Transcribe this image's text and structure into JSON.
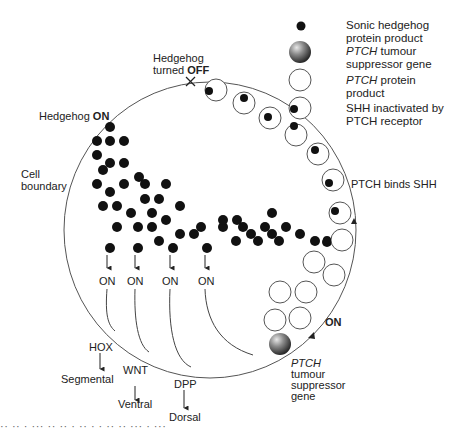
{
  "diagram": {
    "type": "biological-signalling-schematic"
  },
  "legend": {
    "items": [
      {
        "icon": "black-dot-icon",
        "line1": "Sonic hedgehog",
        "line2": "protein product",
        "italic_prefix": ""
      },
      {
        "icon": "shaded-sphere-icon",
        "line1_italic": "PTCH",
        "line1_rest": " tumour",
        "line2": "suppressor gene"
      },
      {
        "icon": "open-circle-icon",
        "line1_italic": "PTCH",
        "line1_rest": " protein",
        "line2": "product"
      },
      {
        "icon": "circle-with-dot-icon",
        "line1": "SHH inactivated by",
        "line2": "PTCH receptor"
      }
    ]
  },
  "labels": {
    "hedgehog_off_line1": "Hedgehog",
    "hedgehog_off_line2_pre": "turned ",
    "hedgehog_off_line2_bold": "OFF",
    "hedgehog_on_pre": "Hedgehog ",
    "hedgehog_on_bold": "ON",
    "cell_boundary_line1": "Cell",
    "cell_boundary_line2": "boundary",
    "ptch_binds_shh": "PTCH binds SHH",
    "ptch_on": "ON",
    "ptch_gene_line1": "PTCH",
    "ptch_gene_line2": "tumour",
    "ptch_gene_line3": "suppressor",
    "ptch_gene_line4": "gene",
    "on_labels": [
      "ON",
      "ON",
      "ON",
      "ON"
    ],
    "targets": [
      {
        "gene": "HOX",
        "outcome": "Segmental"
      },
      {
        "gene": "WNT",
        "outcome": "Ventral"
      },
      {
        "gene": "DPP",
        "outcome": "Dorsal"
      }
    ],
    "off_marker": "×"
  },
  "colors": {
    "ink": "#222222",
    "line": "#555555",
    "dot": "#111111",
    "background": "#ffffff"
  },
  "cut_off_caption": "·· ·· · ··· ·· ·· · ·· · · ·· ·· ··· · ···"
}
